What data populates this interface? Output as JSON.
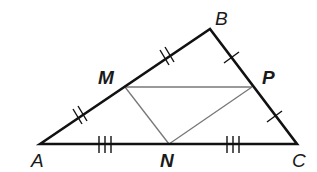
{
  "diagram": {
    "type": "triangle-midsegments",
    "colors": {
      "outer_stroke": "#111111",
      "inner_stroke": "#777777",
      "label": "#1a1a1a",
      "background": "#ffffff"
    },
    "vertices": {
      "A": {
        "label": "A",
        "x": 40,
        "y": 144
      },
      "B": {
        "label": "B",
        "x": 210,
        "y": 29
      },
      "C": {
        "label": "C",
        "x": 297,
        "y": 144
      }
    },
    "midpoints": {
      "M": {
        "label": "M",
        "on": "AB",
        "x": 125,
        "y": 87
      },
      "P": {
        "label": "P",
        "on": "BC",
        "x": 252,
        "y": 87
      },
      "N": {
        "label": "N",
        "on": "AC",
        "x": 169,
        "y": 144
      }
    },
    "segments_outer": [
      "AB",
      "BC",
      "CA"
    ],
    "segments_inner": [
      "MP",
      "MN",
      "NP"
    ],
    "tick_marks": [
      {
        "segment": "AM",
        "count": 2
      },
      {
        "segment": "MB",
        "count": 2
      },
      {
        "segment": "BP",
        "count": 1
      },
      {
        "segment": "PC",
        "count": 1
      },
      {
        "segment": "AN",
        "count": 3
      },
      {
        "segment": "NC",
        "count": 3
      }
    ]
  }
}
